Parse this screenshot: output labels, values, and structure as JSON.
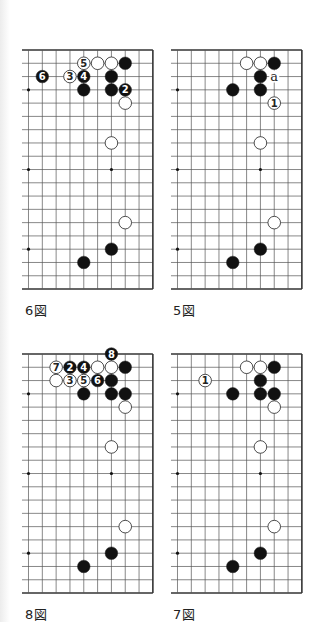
{
  "page": {
    "background": "#ffffff",
    "line_color": "#555555",
    "edge_color": "#333333",
    "black_stone": "#111111",
    "white_stone": "#ffffff"
  },
  "grid": {
    "cols_shown": 10,
    "rows_shown": 19,
    "col_spacing": 13.82,
    "row_spacing": 13.28,
    "star_points": [
      [
        0,
        3
      ],
      [
        6,
        3
      ],
      [
        0,
        9
      ],
      [
        6,
        9
      ],
      [
        0,
        15
      ],
      [
        6,
        15
      ]
    ]
  },
  "diagrams": [
    {
      "id": "fig6",
      "label": "6図",
      "origin": [
        28.6,
        50
      ],
      "label_pos": [
        25,
        300
      ],
      "stones": [
        {
          "c": 4,
          "r": 1,
          "color": "white",
          "num": "5"
        },
        {
          "c": 5,
          "r": 1,
          "color": "white",
          "num": ""
        },
        {
          "c": 6,
          "r": 1,
          "color": "white",
          "num": ""
        },
        {
          "c": 7,
          "r": 1,
          "color": "black",
          "num": ""
        },
        {
          "c": 1,
          "r": 2,
          "color": "black",
          "num": "6"
        },
        {
          "c": 3,
          "r": 2,
          "color": "white",
          "num": "3"
        },
        {
          "c": 4,
          "r": 2,
          "color": "black",
          "num": "4"
        },
        {
          "c": 6,
          "r": 2,
          "color": "black",
          "num": ""
        },
        {
          "c": 4,
          "r": 3,
          "color": "black",
          "num": ""
        },
        {
          "c": 6,
          "r": 3,
          "color": "black",
          "num": ""
        },
        {
          "c": 7,
          "r": 3,
          "color": "black",
          "num": "2"
        },
        {
          "c": 7,
          "r": 4,
          "color": "white",
          "num": ""
        },
        {
          "c": 6,
          "r": 7,
          "color": "white",
          "num": ""
        },
        {
          "c": 7,
          "r": 13,
          "color": "white",
          "num": ""
        },
        {
          "c": 6,
          "r": 15,
          "color": "black",
          "num": ""
        },
        {
          "c": 4,
          "r": 16,
          "color": "black",
          "num": ""
        }
      ],
      "marks": []
    },
    {
      "id": "fig5",
      "label": "5図",
      "origin": [
        177.1,
        50
      ],
      "label_pos": [
        173,
        300
      ],
      "stones": [
        {
          "c": 5,
          "r": 1,
          "color": "white",
          "num": ""
        },
        {
          "c": 6,
          "r": 1,
          "color": "white",
          "num": ""
        },
        {
          "c": 7,
          "r": 1,
          "color": "black",
          "num": ""
        },
        {
          "c": 6,
          "r": 2,
          "color": "black",
          "num": ""
        },
        {
          "c": 4,
          "r": 3,
          "color": "black",
          "num": ""
        },
        {
          "c": 6,
          "r": 3,
          "color": "black",
          "num": ""
        },
        {
          "c": 7,
          "r": 4,
          "color": "white",
          "num": "1"
        },
        {
          "c": 6,
          "r": 7,
          "color": "white",
          "num": ""
        },
        {
          "c": 7,
          "r": 13,
          "color": "white",
          "num": ""
        },
        {
          "c": 6,
          "r": 15,
          "color": "black",
          "num": ""
        },
        {
          "c": 4,
          "r": 16,
          "color": "black",
          "num": ""
        }
      ],
      "marks": [
        {
          "c": 7,
          "r": 2,
          "text": "a"
        }
      ]
    },
    {
      "id": "fig8",
      "label": "8図",
      "origin": [
        28.6,
        354
      ],
      "label_pos": [
        25,
        604
      ],
      "stones": [
        {
          "c": 6,
          "r": 0,
          "color": "black",
          "num": "8"
        },
        {
          "c": 2,
          "r": 1,
          "color": "white",
          "num": "7"
        },
        {
          "c": 3,
          "r": 1,
          "color": "black",
          "num": "2"
        },
        {
          "c": 4,
          "r": 1,
          "color": "black",
          "num": "4"
        },
        {
          "c": 5,
          "r": 1,
          "color": "white",
          "num": ""
        },
        {
          "c": 6,
          "r": 1,
          "color": "white",
          "num": ""
        },
        {
          "c": 7,
          "r": 1,
          "color": "black",
          "num": ""
        },
        {
          "c": 2,
          "r": 2,
          "color": "white",
          "num": ""
        },
        {
          "c": 3,
          "r": 2,
          "color": "white",
          "num": "3"
        },
        {
          "c": 4,
          "r": 2,
          "color": "white",
          "num": "5"
        },
        {
          "c": 5,
          "r": 2,
          "color": "black",
          "num": "6"
        },
        {
          "c": 6,
          "r": 2,
          "color": "black",
          "num": ""
        },
        {
          "c": 4,
          "r": 3,
          "color": "black",
          "num": ""
        },
        {
          "c": 6,
          "r": 3,
          "color": "black",
          "num": ""
        },
        {
          "c": 7,
          "r": 3,
          "color": "black",
          "num": ""
        },
        {
          "c": 7,
          "r": 4,
          "color": "white",
          "num": ""
        },
        {
          "c": 6,
          "r": 7,
          "color": "white",
          "num": ""
        },
        {
          "c": 7,
          "r": 13,
          "color": "white",
          "num": ""
        },
        {
          "c": 6,
          "r": 15,
          "color": "black",
          "num": ""
        },
        {
          "c": 4,
          "r": 16,
          "color": "black",
          "num": ""
        }
      ],
      "marks": []
    },
    {
      "id": "fig7",
      "label": "7図",
      "origin": [
        177.1,
        354
      ],
      "label_pos": [
        173,
        604
      ],
      "stones": [
        {
          "c": 5,
          "r": 1,
          "color": "white",
          "num": ""
        },
        {
          "c": 6,
          "r": 1,
          "color": "white",
          "num": ""
        },
        {
          "c": 7,
          "r": 1,
          "color": "black",
          "num": ""
        },
        {
          "c": 2,
          "r": 2,
          "color": "white",
          "num": "1"
        },
        {
          "c": 6,
          "r": 2,
          "color": "black",
          "num": ""
        },
        {
          "c": 4,
          "r": 3,
          "color": "black",
          "num": ""
        },
        {
          "c": 6,
          "r": 3,
          "color": "black",
          "num": ""
        },
        {
          "c": 7,
          "r": 3,
          "color": "black",
          "num": ""
        },
        {
          "c": 7,
          "r": 4,
          "color": "white",
          "num": ""
        },
        {
          "c": 6,
          "r": 7,
          "color": "white",
          "num": ""
        },
        {
          "c": 7,
          "r": 13,
          "color": "white",
          "num": ""
        },
        {
          "c": 6,
          "r": 15,
          "color": "black",
          "num": ""
        },
        {
          "c": 4,
          "r": 16,
          "color": "black",
          "num": ""
        }
      ],
      "marks": []
    }
  ]
}
